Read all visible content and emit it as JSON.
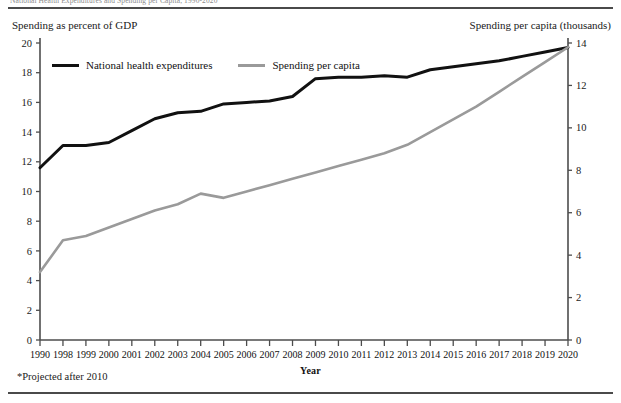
{
  "page": {
    "clipped_header_text": "National Health Expenditures and Spending per Capita, 1990-2020",
    "left_axis_caption": "Spending as percent of GDP",
    "right_axis_caption": "Spending per capita (thousands)",
    "footnote": "*Projected after 2010"
  },
  "chart_data": {
    "type": "line",
    "title": "",
    "xlabel": "Year",
    "ylabel": "Spending as percent of GDP",
    "y2label": "Spending per capita (thousands)",
    "grid": false,
    "legend_position": "top-left-inside",
    "ylim": [
      0,
      20
    ],
    "yticks": [
      0,
      2,
      4,
      6,
      8,
      10,
      12,
      14,
      16,
      18,
      20
    ],
    "y2lim": [
      0,
      14
    ],
    "y2ticks": [
      0,
      2,
      4,
      6,
      8,
      10,
      12,
      14
    ],
    "categories": [
      "1990",
      "1998",
      "1999",
      "2000",
      "2001",
      "2002",
      "2003",
      "2004",
      "2005",
      "2006",
      "2007",
      "2008",
      "2009",
      "2010",
      "2011",
      "2012",
      "2013",
      "2014",
      "2015",
      "2016",
      "2017",
      "2018",
      "2019",
      "2020"
    ],
    "series": [
      {
        "name": "National health expenditures",
        "axis": "left",
        "color": "#111111",
        "width": 3.0,
        "values": [
          11.6,
          13.1,
          13.1,
          13.3,
          14.1,
          14.9,
          15.3,
          15.4,
          15.9,
          16.0,
          16.1,
          16.4,
          17.6,
          17.7,
          17.7,
          17.8,
          17.7,
          18.2,
          18.4,
          18.6,
          18.8,
          19.1,
          19.4,
          19.7
        ]
      },
      {
        "name": "Spending per capita",
        "axis": "right",
        "color": "#9a9a9a",
        "width": 2.6,
        "values": [
          3.2,
          4.7,
          4.9,
          5.3,
          5.7,
          6.1,
          6.4,
          6.9,
          6.7,
          7.0,
          7.3,
          7.6,
          7.9,
          8.2,
          8.5,
          8.8,
          9.2,
          9.8,
          10.4,
          11.0,
          11.7,
          12.4,
          13.1,
          13.8
        ]
      }
    ]
  },
  "legend": {
    "items": [
      {
        "label": "National health expenditures",
        "color": "#111111"
      },
      {
        "label": "Spending per capita",
        "color": "#9a9a9a"
      }
    ]
  }
}
